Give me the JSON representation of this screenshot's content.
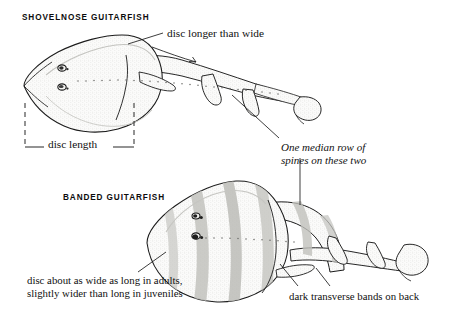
{
  "plate": {
    "title": "Guitarfish identification plate",
    "background_color": "#ffffff",
    "ink_color": "#111111",
    "width": 458,
    "height": 319
  },
  "species": [
    {
      "id": "shovelnose",
      "label": "SHOVELNOSE  GUITARFISH",
      "position": "upper",
      "disc_shape": "pointed triangular, longer than wide"
    },
    {
      "id": "banded",
      "label": "BANDED  GUITARFISH",
      "position": "lower",
      "disc_shape": "rounded, about as wide as long"
    }
  ],
  "annotations": {
    "disc_longer_than_wide": "disc longer than wide",
    "disc_length": "disc length",
    "median_row_line1": "One median row of",
    "median_row_line2": "spines on these two",
    "disc_wide_line1": "disc about as wide as long in adults,",
    "disc_wide_line2": "slightly wider than long in juveniles",
    "dark_bands": "dark transverse bands on back"
  },
  "figure_parts": {
    "eye": "eye",
    "spiracle": "spiracle",
    "first_dorsal_fin": "first dorsal fin",
    "second_dorsal_fin": "second dorsal fin",
    "caudal_fin": "caudal fin",
    "pectoral_disc": "pectoral disc",
    "median_spine_row": "median row of spines",
    "transverse_bands": "dark transverse bands"
  }
}
